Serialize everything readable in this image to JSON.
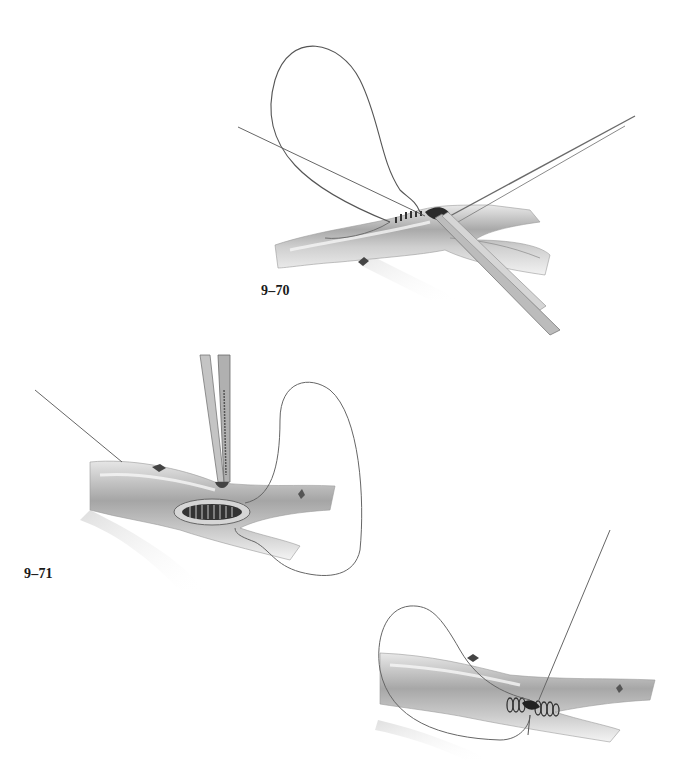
{
  "page": {
    "background": "#ffffff",
    "ink_color": "#1a1a1a"
  },
  "figures": [
    {
      "id": "9-70",
      "label": "9–70",
      "description": "Vessel anastomosis: running suture loop with forceps and needle holder at suture line"
    },
    {
      "id": "9-71",
      "label": "9–71",
      "description": "Vessel with elongated anastomosis opening, forceps lifting vessel wall, long suture loop to the right"
    },
    {
      "id": "9-72",
      "label": "",
      "description": "Completed running suture encircling vessel, suture loop to the left, straight needle going up-right"
    }
  ]
}
